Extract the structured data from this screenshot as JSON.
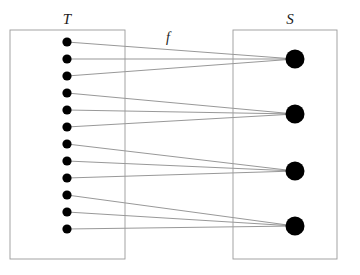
{
  "figure": {
    "type": "set-mapping-diagram",
    "domain_set": {
      "label": "T",
      "label_x": 67,
      "label_y": 24,
      "box": {
        "x": 10,
        "y": 30,
        "width": 115,
        "height": 229
      },
      "element_x": 67,
      "element_radius": 4.6,
      "element_color": "#000000",
      "elements_y": [
        42,
        59,
        76,
        93,
        110,
        127,
        144,
        161,
        178,
        195,
        212,
        229
      ]
    },
    "codomain_set": {
      "label": "S",
      "label_x": 290,
      "label_y": 24,
      "box": {
        "x": 233,
        "y": 30,
        "width": 104,
        "height": 229
      },
      "element_x": 295,
      "element_radius": 9.5,
      "element_color": "#000000",
      "elements_y": [
        59,
        114,
        171,
        226
      ]
    },
    "map": {
      "label": "f",
      "label_x": 168,
      "label_y": 42,
      "line_color": "#6b6b6b",
      "line_width": 0.7,
      "edges": [
        {
          "from": 0,
          "to": 0
        },
        {
          "from": 1,
          "to": 0
        },
        {
          "from": 2,
          "to": 0
        },
        {
          "from": 3,
          "to": 1
        },
        {
          "from": 4,
          "to": 1
        },
        {
          "from": 5,
          "to": 1
        },
        {
          "from": 6,
          "to": 2
        },
        {
          "from": 7,
          "to": 2
        },
        {
          "from": 8,
          "to": 2
        },
        {
          "from": 9,
          "to": 3
        },
        {
          "from": 10,
          "to": 3
        },
        {
          "from": 11,
          "to": 3
        }
      ]
    },
    "style": {
      "background": "#ffffff",
      "box_stroke": "#9a9a9a",
      "box_stroke_width": 0.9,
      "box_fill": "none"
    }
  }
}
